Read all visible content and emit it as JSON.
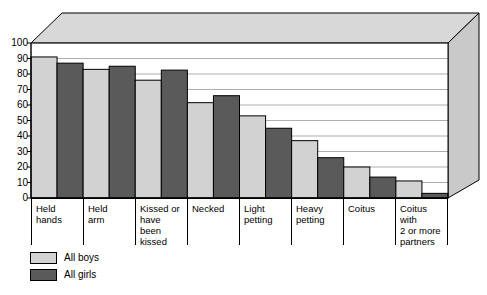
{
  "chart_data": {
    "type": "bar",
    "title": "",
    "subtitle": "",
    "xlabel": "",
    "ylabel": "",
    "ylim": [
      0,
      100
    ],
    "yticks": [
      0,
      10,
      20,
      30,
      40,
      50,
      60,
      70,
      80,
      90,
      100
    ],
    "ytick_labels": [
      "0",
      "10",
      "20",
      "30",
      "40",
      "50",
      "60",
      "70",
      "80",
      "90",
      "100"
    ],
    "grid": true,
    "grid_axis": "y",
    "legend_position": "bottom-left",
    "categories": [
      "Held hands",
      "Held arm",
      "Kissed or have been kissed",
      "Necked",
      "Light petting",
      "Heavy petting",
      "Coitus",
      "Coitus with 2 or more partners"
    ],
    "category_lines": [
      [
        "Held",
        "hands"
      ],
      [
        "Held",
        "arm"
      ],
      [
        "Kissed or",
        "have been",
        "kissed"
      ],
      [
        "Necked"
      ],
      [
        "Light",
        "petting"
      ],
      [
        "Heavy",
        "petting"
      ],
      [
        "Coitus"
      ],
      [
        "Coitus with",
        "2 or more",
        "partners"
      ]
    ],
    "series": [
      {
        "name": "All boys",
        "color": "#d2d2d2",
        "values": [
          91,
          83,
          76,
          61.5,
          53,
          37,
          20,
          11
        ]
      },
      {
        "name": "All girls",
        "color": "#5a5a5a",
        "values": [
          87,
          85,
          82.5,
          66,
          45,
          26,
          13.5,
          3
        ]
      }
    ]
  },
  "legend": {
    "items": [
      {
        "label": "All boys",
        "color": "#d2d2d2"
      },
      {
        "label": "All girls",
        "color": "#5a5a5a"
      }
    ]
  },
  "style": {
    "plot_bg": "#ffffff",
    "box_top_face": "#d8d8d8",
    "box_side_face": "#c9c9c9",
    "gridline_color": "#9a9a9a",
    "axis_color": "#000000"
  }
}
